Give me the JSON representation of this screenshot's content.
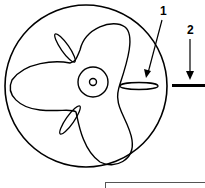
{
  "figure": {
    "callouts": [
      {
        "label": "1",
        "target": "fin"
      },
      {
        "label": "2",
        "target": "shaft line"
      }
    ],
    "caption_box_text": "",
    "colors": {
      "stroke": "#000000",
      "background": "#ffffff"
    }
  }
}
